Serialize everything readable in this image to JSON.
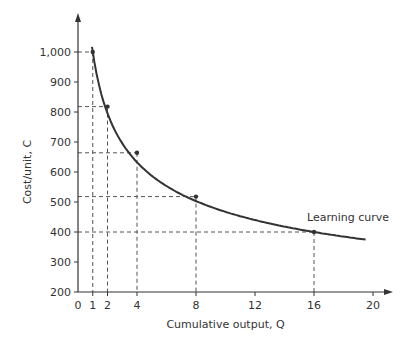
{
  "chart_data": {
    "type": "line",
    "title": "",
    "xlabel": "Cumulative output, Q",
    "ylabel": "Cost/unit, C",
    "xlim": [
      0,
      20
    ],
    "ylim": [
      200,
      1100
    ],
    "grid": false,
    "x_ticks": [
      0,
      1,
      2,
      4,
      8,
      12,
      16,
      20
    ],
    "y_ticks": [
      200,
      300,
      400,
      500,
      600,
      700,
      800,
      900,
      1000
    ],
    "y_tick_labels": [
      "200",
      "300",
      "400",
      "500",
      "600",
      "700",
      "800",
      "900",
      "1,000"
    ],
    "series": [
      {
        "name": "Learning curve",
        "x": [
          1,
          2,
          4,
          8,
          16
        ],
        "values": [
          1000,
          818,
          664,
          518,
          400
        ]
      }
    ],
    "curve_extent": {
      "x_start": 0.95,
      "x_end": 19.5,
      "y_end": 375
    },
    "annotations": [
      {
        "text": "Learning curve",
        "x": 16,
        "y": 430
      }
    ],
    "marked_points": [
      {
        "x": 1,
        "y": 1000
      },
      {
        "x": 2,
        "y": 818
      },
      {
        "x": 4,
        "y": 664
      },
      {
        "x": 8,
        "y": 518
      },
      {
        "x": 16,
        "y": 400
      }
    ],
    "colors": {
      "curve": "#333333",
      "axis": "#333333",
      "guides": "#555555"
    }
  }
}
